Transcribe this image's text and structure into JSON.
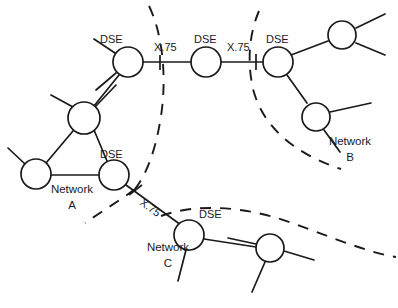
{
  "figure": {
    "kind": "network-topology-diagram",
    "background_color": "#ffffff",
    "line_color": "#1a1a1a",
    "width": 398,
    "height": 308
  },
  "labels": {
    "dse_top_left": "DSE",
    "dse_top_middle": "DSE",
    "dse_top_right": "DSE",
    "dse_network_a": "DSE",
    "dse_network_c": "DSE",
    "x75_left": "X.75",
    "x75_right": "X.75",
    "x75_diagonal": "X.75",
    "network_a_line1": "Network",
    "network_a_line2": "A",
    "network_b_line1": "Network",
    "network_b_line2": "B",
    "network_c_line1": "Network",
    "network_c_line2": "C"
  },
  "networks": [
    {
      "id": "A",
      "name": "Network A",
      "label_text": "Network\nA",
      "boundary_style": "dashed-arc",
      "nodes": [
        "node-a-top",
        "node-a-left",
        "node-a-dse"
      ]
    },
    {
      "id": "B",
      "name": "Network B",
      "label_text": "Network\nB",
      "boundary_style": "dashed-arc",
      "nodes": [
        "node-b-dse",
        "node-b-upper",
        "node-b-lower"
      ]
    },
    {
      "id": "C",
      "name": "Network C",
      "label_text": "Network\nC",
      "boundary_style": "dashed-arc",
      "nodes": [
        "node-c-dse",
        "node-c-right"
      ]
    }
  ],
  "nodes": [
    {
      "id": "node-a-dse-top",
      "cx": 128,
      "cy": 62,
      "r": 15,
      "label": "DSE",
      "label_x": 99,
      "label_y": 43
    },
    {
      "id": "node-mid-dse",
      "cx": 206,
      "cy": 62,
      "r": 15,
      "label": "DSE",
      "label_x": 194,
      "label_y": 43
    },
    {
      "id": "node-b-dse",
      "cx": 278,
      "cy": 62,
      "r": 15,
      "label": "DSE",
      "label_x": 265,
      "label_y": 43
    },
    {
      "id": "node-b-upper",
      "cx": 342,
      "cy": 35,
      "r": 15,
      "label": "",
      "label_x": 0,
      "label_y": 0
    },
    {
      "id": "node-b-lower",
      "cx": 316,
      "cy": 117,
      "r": 15,
      "label": "",
      "label_x": 0,
      "label_y": 0
    },
    {
      "id": "node-a-top",
      "cx": 84,
      "cy": 118,
      "r": 16,
      "label": "",
      "label_x": 0,
      "label_y": 0
    },
    {
      "id": "node-a-left",
      "cx": 36,
      "cy": 174,
      "r": 15,
      "label": "",
      "label_x": 0,
      "label_y": 0
    },
    {
      "id": "node-a-dse",
      "cx": 114,
      "cy": 175,
      "r": 15,
      "label": "DSE",
      "label_x": 100,
      "label_y": 157
    },
    {
      "id": "node-c-dse",
      "cx": 189,
      "cy": 235,
      "r": 15,
      "label": "DSE",
      "label_x": 198,
      "label_y": 217
    },
    {
      "id": "node-c-right",
      "cx": 270,
      "cy": 248,
      "r": 14,
      "label": "",
      "label_x": 0,
      "label_y": 0
    }
  ],
  "trunk_links": [
    {
      "from": "node-a-dse-top",
      "to": "node-mid-dse",
      "label": "X.75",
      "label_x": 155,
      "label_y": 50
    },
    {
      "from": "node-mid-dse",
      "to": "node-b-dse",
      "label": "X.75",
      "label_x": 228,
      "label_y": 50
    },
    {
      "from": "node-a-dse",
      "to": "node-c-dse",
      "label": "X.75",
      "label_x": 141,
      "label_y": 198
    }
  ],
  "intra_links": [
    {
      "from": "node-a-dse-top",
      "to": "node-a-top"
    },
    {
      "from": "node-a-top",
      "to": "node-a-left"
    },
    {
      "from": "node-a-top",
      "to": "node-a-dse"
    },
    {
      "from": "node-a-left",
      "to": "node-a-dse"
    },
    {
      "from": "node-b-dse",
      "to": "node-b-upper"
    },
    {
      "from": "node-b-dse",
      "to": "node-b-lower"
    },
    {
      "from": "node-c-dse",
      "to": "node-c-right"
    }
  ],
  "network_label_positions": {
    "a": {
      "x": 72,
      "y1": 190,
      "y2": 206
    },
    "b": {
      "x": 349,
      "y1": 140,
      "y2": 156
    },
    "c": {
      "x": 167,
      "y1": 247,
      "y2": 263
    }
  }
}
